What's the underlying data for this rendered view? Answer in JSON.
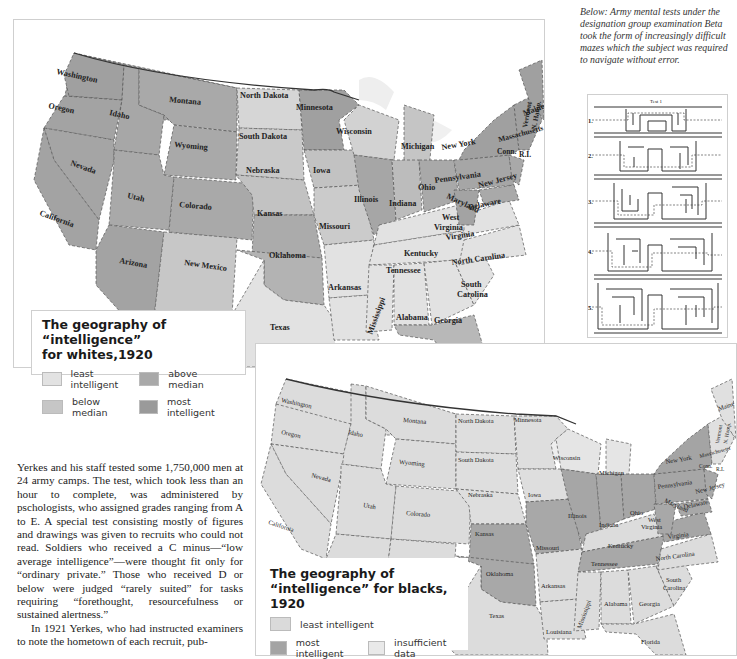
{
  "caption": "Below:  Army mental tests under the designation group examination Beta took the form of increasingly difficult mazes which the subject was required to navigate without error.",
  "maze": {
    "title": "Test 1",
    "rows": [
      "1.",
      "2.",
      "3.",
      "4.",
      "5."
    ]
  },
  "map_whites": {
    "legend_title_line1": "The geography of “intelligence”",
    "legend_title_line2": "for whites,1920",
    "legend": [
      {
        "label": "least intelligent",
        "color": "#e2e2e2"
      },
      {
        "label": "above median",
        "color": "#a9a9a9"
      },
      {
        "label": "below median",
        "color": "#c6c6c6"
      },
      {
        "label": "most intelligent",
        "color": "#9a9a9a"
      }
    ],
    "states": {
      "washington": "Washington",
      "oregon": "Oregon",
      "idaho": "Idaho",
      "montana": "Montana",
      "north_dakota": "North Dakota",
      "minnesota": "Minnesota",
      "wisconsin": "Wisconsin",
      "south_dakota": "South Dakota",
      "wyoming": "Wyoming",
      "nevada": "Nevada",
      "utah": "Utah",
      "california": "California",
      "colorado": "Colorado",
      "nebraska": "Nebraska",
      "iowa": "Iowa",
      "kansas": "Kansas",
      "missouri": "Missouri",
      "illinois": "Illinois",
      "michigan": "Michigan",
      "indiana": "Indiana",
      "ohio": "Ohio",
      "arizona": "Arizona",
      "new_mexico": "New Mexico",
      "oklahoma": "Oklahoma",
      "texas": "Texas",
      "arkansas": "Arkansas",
      "louisiana": "Louisiana",
      "mississippi": "Mississippi",
      "alabama": "Alabama",
      "georgia": "Georgia",
      "florida": "Florida",
      "tennessee": "Tennessee",
      "kentucky": "Kentucky",
      "north_carolina": "North Carolina",
      "south_carolina_1": "South",
      "south_carolina_2": "Carolina",
      "virginia": "Virginia",
      "west_virginia_1": "West",
      "west_virginia_2": "Virginia",
      "pennsylvania": "Pennsylvania",
      "new_york": "New York",
      "maryland": "Maryland",
      "delaware": "Delaware",
      "new_jersey": "New Jersey",
      "vermont": "Vermont",
      "new_hampshire": "N. Hamp.",
      "maine": "Maine",
      "massachusetts": "Massachusetts",
      "connecticut": "Conn.",
      "rhode_island": "R.I."
    }
  },
  "map_blacks": {
    "legend_title_line1": "The geography of",
    "legend_title_line2": "“intelligence” for blacks, 1920",
    "legend": [
      {
        "label": "least intelligent",
        "color": "#dadada"
      },
      {
        "label": "most intelligent",
        "color": "#a4a4a4"
      },
      {
        "label": "insufficient data",
        "color": "#e9e9e9"
      }
    ],
    "states": {
      "washington": "Washington",
      "oregon": "Oregon",
      "idaho": "Idaho",
      "montana": "Montana",
      "north_dakota": "North Dakota",
      "minnesota": "Minnesota",
      "wisconsin": "Wisconsin",
      "south_dakota": "South Dakota",
      "wyoming": "Wyoming",
      "nevada": "Nevada",
      "utah": "Utah",
      "california": "California",
      "colorado": "Colorado",
      "nebraska": "Nebraska",
      "iowa": "Iowa",
      "kansas": "Kansas",
      "missouri": "Missouri",
      "illinois": "Illinois",
      "michigan": "Michigan",
      "indiana": "Indiana",
      "ohio": "Ohio",
      "arizona": "Arizona",
      "new_mexico": "New Mexico",
      "oklahoma": "Oklahoma",
      "texas": "Texas",
      "arkansas": "Arkansas",
      "louisiana": "Louisiana",
      "mississippi": "Mississippi",
      "alabama": "Alabama",
      "georgia": "Georgia",
      "florida": "Florida",
      "tennessee": "Tennessee",
      "kentucky": "Kentucky",
      "north_carolina": "North Carolina",
      "south_carolina_1": "South",
      "south_carolina_2": "Carolina",
      "virginia": "Virginia",
      "west_virginia_1": "West",
      "west_virginia_2": "Virginia",
      "pennsylvania": "Pennsylvania",
      "new_york": "New York",
      "maryland": "Maryland",
      "delaware": "Delaware",
      "new_jersey": "New Jersey",
      "vermont": "Vermont",
      "new_hampshire": "N. Hamp.",
      "maine": "Maine",
      "massachusetts": "Massachusetts",
      "connecticut": "Conn.",
      "rhode_island": "R.I."
    }
  },
  "body_text": {
    "paragraph1": "Yerkes and his staff tested some 1,750,000 men at 24 army camps. The test, which took less than an hour to complete, was administered by pschologists, who assigned grades ranging from A to E. A special test consisting mostly of figures and drawings was given to recruits who could not read. Soldiers who received a C minus—“low average intelligence”—were thought fit only for “ordinary private.” Those who received D or below were judged “rarely suited” for tasks requiring “forethought, resourcefulness or sustained alertness.”",
    "paragraph2": "In 1921 Yerkes, who had instructed examiners to note the hometown of each recruit, pub-"
  }
}
